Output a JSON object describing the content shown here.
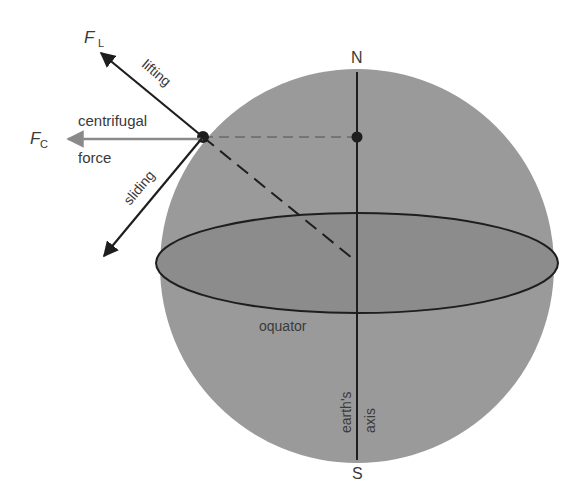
{
  "diagram": {
    "labels": {
      "force_lifting_symbol": "F",
      "force_lifting_sub": "L",
      "force_centrifugal_symbol": "F",
      "force_centrifugal_sub": "C",
      "lifting": "lifting",
      "centrifugal": "centrifugal",
      "force": "force",
      "sliding": "sliding",
      "north": "N",
      "south": "S",
      "equator": "oquator",
      "earths": "earth's",
      "axis": "axis"
    },
    "colors": {
      "sphere_fill": "#9a9a9a",
      "equator_fill": "#8a8a8a",
      "line": "#1e1e1e",
      "centrifugal_arrow": "#7a7a7a",
      "text": "#3a3a3a"
    }
  }
}
